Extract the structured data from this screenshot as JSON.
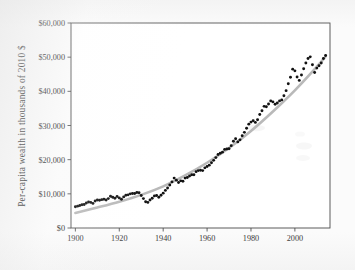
{
  "figure": {
    "name": "per-capita-wealth-scatter",
    "background_color": "#fbfbfb"
  },
  "chart_data": {
    "type": "scatter",
    "title": "",
    "subtitle": "",
    "xlabel": "",
    "ylabel": "Per-capita wealth in thousands of 2010 $",
    "xlim": [
      1898,
      2016
    ],
    "ylim": [
      0,
      60000
    ],
    "grid": false,
    "legend": null,
    "xticks": [
      1900,
      1920,
      1940,
      1960,
      1980,
      2000
    ],
    "xtick_labels": [
      "1900",
      "1920",
      "1940",
      "1960",
      "1980",
      "2000"
    ],
    "yticks": [
      0,
      10000,
      20000,
      30000,
      40000,
      50000,
      60000
    ],
    "ytick_labels": [
      "$0",
      "$10,000",
      "$20,000",
      "$30,000",
      "$40,000",
      "$50,000",
      "$60,000"
    ],
    "marker_color": "#121212",
    "trend_color": "#b9b9b9",
    "series": [
      {
        "name": "per-capita wealth",
        "kind": "scatter",
        "x": [
          1900,
          1901,
          1902,
          1903,
          1904,
          1905,
          1906,
          1907,
          1908,
          1909,
          1910,
          1911,
          1912,
          1913,
          1914,
          1915,
          1916,
          1917,
          1918,
          1919,
          1920,
          1921,
          1922,
          1923,
          1924,
          1925,
          1926,
          1927,
          1928,
          1929,
          1930,
          1931,
          1932,
          1933,
          1934,
          1935,
          1936,
          1937,
          1938,
          1939,
          1940,
          1941,
          1942,
          1943,
          1944,
          1945,
          1946,
          1947,
          1948,
          1949,
          1950,
          1951,
          1952,
          1953,
          1954,
          1955,
          1956,
          1957,
          1958,
          1959,
          1960,
          1961,
          1962,
          1963,
          1964,
          1965,
          1966,
          1967,
          1968,
          1969,
          1970,
          1971,
          1972,
          1973,
          1974,
          1975,
          1976,
          1977,
          1978,
          1979,
          1980,
          1981,
          1982,
          1983,
          1984,
          1985,
          1986,
          1987,
          1988,
          1989,
          1990,
          1991,
          1992,
          1993,
          1994,
          1995,
          1996,
          1997,
          1998,
          1999,
          2000,
          2001,
          2002,
          2003,
          2004,
          2005,
          2006,
          2007,
          2008,
          2009,
          2010,
          2011,
          2012,
          2013,
          2014
        ],
        "y": [
          6200,
          6400,
          6600,
          6800,
          6900,
          7300,
          7600,
          7500,
          7200,
          7900,
          8200,
          8100,
          8300,
          8400,
          8200,
          8600,
          9300,
          9000,
          8700,
          9200,
          8800,
          8400,
          9100,
          9600,
          9700,
          10000,
          10100,
          10100,
          10400,
          10300,
          9500,
          8600,
          7700,
          7500,
          8200,
          8700,
          9400,
          9500,
          9000,
          9600,
          10200,
          11000,
          11700,
          12600,
          13500,
          14600,
          14000,
          13300,
          13800,
          13700,
          14600,
          14800,
          15200,
          15600,
          15600,
          16500,
          16800,
          16900,
          16800,
          17600,
          18000,
          18400,
          19100,
          19800,
          20600,
          21500,
          21900,
          22200,
          23000,
          23100,
          23200,
          24100,
          25400,
          26100,
          25200,
          25800,
          27000,
          28000,
          29200,
          30400,
          31000,
          31400,
          30900,
          31700,
          33200,
          34300,
          35600,
          35500,
          36300,
          37200,
          36900,
          36200,
          36600,
          37200,
          37500,
          38700,
          40200,
          42200,
          44100,
          46500,
          46000,
          44200,
          43200,
          44800,
          46600,
          48300,
          49600,
          50100,
          47800,
          45500,
          46800,
          47500,
          48300,
          49600,
          50500
        ]
      },
      {
        "name": "fitted trend",
        "kind": "line",
        "x": [
          1900,
          1910,
          1920,
          1930,
          1940,
          1950,
          1960,
          1970,
          1980,
          1990,
          2000,
          2010,
          2014
        ],
        "y": [
          4400,
          6000,
          7700,
          9700,
          12200,
          15400,
          19100,
          23400,
          28400,
          34100,
          40300,
          47200,
          50200
        ]
      }
    ]
  }
}
